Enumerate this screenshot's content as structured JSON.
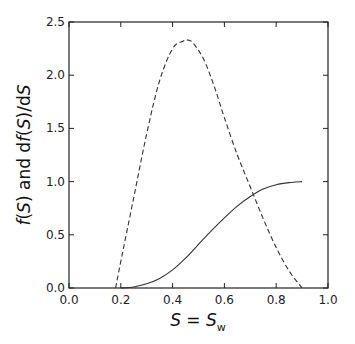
{
  "chart_data": {
    "type": "line",
    "title": "",
    "xlabel": "S = S_w",
    "ylabel": "f(S) and df(S)/dS",
    "xlim": [
      0.0,
      1.0
    ],
    "ylim": [
      0.0,
      2.5
    ],
    "grid": false,
    "legend": null,
    "xticks": [
      "0.0",
      "0.2",
      "0.4",
      "0.6",
      "0.8",
      "1.0"
    ],
    "yticks": [
      "0.0",
      "0.5",
      "1.0",
      "1.5",
      "2.0",
      "2.5"
    ],
    "series": [
      {
        "name": "f(S)",
        "style": "solid",
        "x": [
          0.2,
          0.25,
          0.3,
          0.35,
          0.4,
          0.45,
          0.5,
          0.55,
          0.6,
          0.65,
          0.7,
          0.75,
          0.8,
          0.85,
          0.9
        ],
        "y": [
          0.0,
          0.01,
          0.04,
          0.09,
          0.17,
          0.28,
          0.41,
          0.54,
          0.66,
          0.77,
          0.86,
          0.93,
          0.97,
          0.99,
          1.0
        ]
      },
      {
        "name": "df(S)/dS",
        "style": "dashed",
        "x": [
          0.18,
          0.2,
          0.25,
          0.3,
          0.35,
          0.4,
          0.44,
          0.46,
          0.48,
          0.52,
          0.56,
          0.6,
          0.65,
          0.7,
          0.75,
          0.8,
          0.85,
          0.9
        ],
        "y": [
          0.0,
          0.25,
          0.85,
          1.45,
          1.95,
          2.25,
          2.32,
          2.33,
          2.3,
          2.15,
          1.9,
          1.6,
          1.25,
          0.95,
          0.65,
          0.38,
          0.16,
          0.0
        ]
      }
    ]
  }
}
